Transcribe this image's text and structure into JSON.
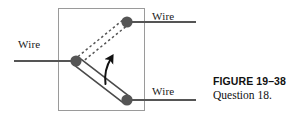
{
  "figure": {
    "caption_title": "FIGURE 19–38",
    "caption_subtitle": "Question 18.",
    "labels": {
      "wire_left": "Wire",
      "wire_top": "Wire",
      "wire_bottom": "Wire"
    },
    "colors": {
      "line": "#555555",
      "node": "#555555",
      "box_border": "#9a9a9a",
      "rod_fill": "#ffffff",
      "rod_stroke": "#4a4a4a",
      "dashed": "#555555",
      "arrow": "#111111",
      "text": "#1a1a1a",
      "background": "#ffffff"
    },
    "geometry": {
      "box": {
        "x": 58,
        "y": 8,
        "width": 86,
        "height": 103
      },
      "pivot_node": {
        "x": 76,
        "y": 61,
        "r": 5.5
      },
      "top_node": {
        "x": 127,
        "y": 22,
        "r": 5.5
      },
      "bottom_node": {
        "x": 127,
        "y": 100,
        "r": 5.5
      },
      "wire_left_line": {
        "x1": 14,
        "y1": 61,
        "x2": 76,
        "y2": 61
      },
      "wire_top_line": {
        "x1": 127,
        "y1": 22,
        "x2": 196,
        "y2": 22
      },
      "wire_bottom_line": {
        "x1": 127,
        "y1": 100,
        "x2": 196,
        "y2": 100
      },
      "rod": {
        "x1": 76,
        "y1": 61,
        "x2": 127,
        "y2": 100,
        "width": 6
      },
      "dashed_upper": {
        "x1": 78,
        "y1": 56,
        "x2": 124,
        "y2": 20
      },
      "dashed_lower": {
        "x1": 80,
        "y1": 62,
        "x2": 126,
        "y2": 26
      },
      "rotation_arrow": {
        "from": [
          106,
          83
        ],
        "to": [
          113,
          55
        ]
      }
    }
  }
}
